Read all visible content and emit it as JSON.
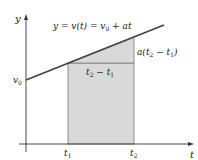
{
  "diagram": {
    "colors": {
      "axis": "#333333",
      "line": "#444444",
      "fill": "#d9d9d9",
      "fill_edge": "#777777",
      "text": "#222222"
    },
    "axes": {
      "x_label": "t",
      "y_label": "y"
    },
    "equation": {
      "lhs": "y = v(t) = v",
      "sub": "0",
      "rhs": " + at"
    },
    "intercept": {
      "main": "v",
      "sub": "0"
    },
    "base_label": {
      "a": "t",
      "a_sub": "2",
      "mid": " − t",
      "b_sub": "1"
    },
    "rise_label": {
      "pre": "a(t",
      "a_sub": "2",
      "mid": " − t",
      "b_sub": "1",
      "post": ")"
    },
    "ticks": {
      "t1": {
        "main": "t",
        "sub": "1"
      },
      "t2": {
        "main": "t",
        "sub": "2"
      }
    }
  }
}
